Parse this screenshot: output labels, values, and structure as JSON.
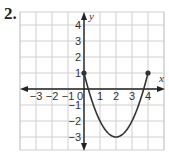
{
  "problem_number": "2.",
  "chart_data": {
    "type": "line",
    "title": "",
    "xlabel": "x",
    "ylabel": "y",
    "xlim": [
      -3.5,
      4.5
    ],
    "ylim": [
      -3.8,
      4.6
    ],
    "grid": true,
    "x_ticks": [
      "-3",
      "-2",
      "-1",
      "0",
      "1",
      "2",
      "3",
      "4"
    ],
    "y_ticks": [
      "4",
      "3",
      "2",
      "1",
      "-1",
      "-2",
      "-3"
    ],
    "series": [
      {
        "name": "parabola",
        "description": "y = x^2 - 4x + 1 on [0, 4]",
        "x": [
          0,
          0.5,
          1,
          1.5,
          2,
          2.5,
          3,
          3.5,
          4
        ],
        "y": [
          1,
          -0.75,
          -2,
          -2.75,
          -3,
          -2.75,
          -2,
          -0.75,
          1
        ],
        "endpoints": [
          {
            "x": 0,
            "y": 1,
            "closed": true
          },
          {
            "x": 4,
            "y": 1,
            "closed": true
          }
        ],
        "vertex": {
          "x": 2,
          "y": -3
        }
      }
    ],
    "colors": {
      "curve": "#333333",
      "grid": "#cfcfcf",
      "axis": "#222222"
    }
  }
}
